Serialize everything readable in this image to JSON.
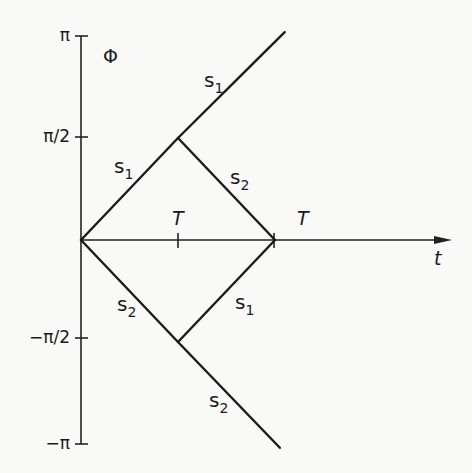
{
  "diagram": {
    "y_axis": {
      "label": "Φ",
      "ticks": [
        {
          "value": 3.14159,
          "label": "π"
        },
        {
          "value": 1.5708,
          "label": "π/2"
        },
        {
          "value": -1.5708,
          "label": "−π/2"
        },
        {
          "value": -3.14159,
          "label": "−π"
        }
      ],
      "range": [
        -3.14159,
        3.14159
      ]
    },
    "x_axis": {
      "label": "t",
      "ticks": [
        {
          "value": 1,
          "label": "T"
        },
        {
          "value": 2,
          "label": "T"
        }
      ]
    },
    "segments": [
      {
        "name": "s1-rise",
        "label": "s",
        "sub": "1",
        "from": [
          0,
          0
        ],
        "to": [
          1,
          1.5708
        ]
      },
      {
        "name": "s1-upper-ray",
        "label": "s",
        "sub": "1",
        "from": [
          1,
          1.5708
        ],
        "to": [
          2.1,
          3.2
        ]
      },
      {
        "name": "s2-fall",
        "label": "s",
        "sub": "2",
        "from": [
          1,
          1.5708
        ],
        "to": [
          2,
          0
        ]
      },
      {
        "name": "s2-descent",
        "label": "s",
        "sub": "2",
        "from": [
          0,
          0
        ],
        "to": [
          1,
          -1.5708
        ]
      },
      {
        "name": "s1-recover",
        "label": "s",
        "sub": "1",
        "from": [
          1,
          -1.5708
        ],
        "to": [
          2,
          0
        ]
      },
      {
        "name": "s2-lower-ray",
        "label": "s",
        "sub": "2",
        "from": [
          1,
          -1.5708
        ],
        "to": [
          2.05,
          -3.2
        ]
      }
    ]
  }
}
